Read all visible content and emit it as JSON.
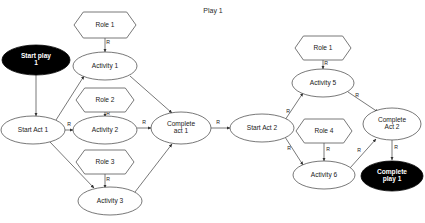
{
  "diagram": {
    "title": "Play 1",
    "title_pos": {
      "x": 213,
      "y": 11
    },
    "colors": {
      "terminal_fill": "#000000",
      "terminal_text": "#ffffff",
      "node_fill": "#ffffff",
      "node_stroke": "#555555",
      "label_text": "#1a1a1a"
    },
    "nodes": [
      {
        "id": "start-play-1",
        "label": "Start play 1",
        "type": "terminal",
        "cx": 36,
        "cy": 60,
        "rx": 34,
        "ry": 15
      },
      {
        "id": "role-1-a",
        "label": "Role 1",
        "type": "role",
        "cx": 105,
        "cy": 25,
        "rx": 31,
        "ry": 13
      },
      {
        "id": "activity-1",
        "label": "Activity 1",
        "type": "activity",
        "cx": 105,
        "cy": 66,
        "rx": 32,
        "ry": 14
      },
      {
        "id": "role-2",
        "label": "Role 2",
        "type": "role",
        "cx": 105,
        "cy": 100,
        "rx": 29,
        "ry": 12
      },
      {
        "id": "start-act-1",
        "label": "Start Act 1",
        "type": "activity",
        "cx": 33,
        "cy": 130,
        "rx": 32,
        "ry": 14
      },
      {
        "id": "activity-2",
        "label": "Activity 2",
        "type": "activity",
        "cx": 105,
        "cy": 130,
        "rx": 32,
        "ry": 14
      },
      {
        "id": "complete-act-1",
        "label_lines": [
          "Complete",
          "act 1"
        ],
        "type": "activity",
        "cx": 181,
        "cy": 128,
        "rx": 30,
        "ry": 16
      },
      {
        "id": "role-3",
        "label": "Role 3",
        "type": "role",
        "cx": 105,
        "cy": 162,
        "rx": 29,
        "ry": 12
      },
      {
        "id": "activity-3",
        "label": "Activity 3",
        "type": "activity",
        "cx": 110,
        "cy": 201,
        "rx": 32,
        "ry": 14
      },
      {
        "id": "start-act-2",
        "label": "Start Act 2",
        "type": "activity",
        "cx": 262,
        "cy": 128,
        "rx": 32,
        "ry": 14
      },
      {
        "id": "role-1-b",
        "label": "Role 1",
        "type": "role",
        "cx": 323,
        "cy": 48,
        "rx": 28,
        "ry": 12
      },
      {
        "id": "activity-5",
        "label": "Activity 5",
        "type": "activity",
        "cx": 323,
        "cy": 83,
        "rx": 31,
        "ry": 14
      },
      {
        "id": "role-4",
        "label": "Role 4",
        "type": "role",
        "cx": 324,
        "cy": 131,
        "rx": 28,
        "ry": 12
      },
      {
        "id": "activity-6",
        "label": "Activity 6",
        "type": "activity",
        "cx": 324,
        "cy": 175,
        "rx": 31,
        "ry": 14
      },
      {
        "id": "complete-act-2",
        "label_lines": [
          "Complete",
          "Act 2"
        ],
        "type": "activity",
        "cx": 392,
        "cy": 124,
        "rx": 29,
        "ry": 16
      },
      {
        "id": "complete-play-1",
        "label_lines": [
          "Complete",
          "play 1"
        ],
        "type": "terminal",
        "cx": 392,
        "cy": 176,
        "rx": 31,
        "ry": 15
      }
    ],
    "edges": [
      {
        "id": "e-startplay-startact1",
        "from": "start-play-1",
        "to": "start-act-1",
        "label": "",
        "path": "M 36,75 L 36,116",
        "arrow": true,
        "label_pos": null
      },
      {
        "id": "e-role1a-activity1",
        "from": "role-1-a",
        "to": "activity-1",
        "label": "R",
        "path": "M 105,38 L 105,52",
        "arrow": true,
        "label_pos": {
          "x": 108,
          "y": 43
        }
      },
      {
        "id": "e-startact1-activity1",
        "from": "start-act-1",
        "to": "activity-1",
        "label": "",
        "path": "M 56,120 L 84,76",
        "arrow": true,
        "label_pos": null
      },
      {
        "id": "e-startact1-activity2",
        "from": "start-act-1",
        "to": "activity-2",
        "label": "R",
        "path": "M 65,130 L 73,130",
        "arrow": true,
        "label_pos": {
          "x": 69,
          "y": 125
        }
      },
      {
        "id": "e-startact1-activity3",
        "from": "start-act-1",
        "to": "activity-3",
        "label": "",
        "path": "M 50,142 L 94,188",
        "arrow": true,
        "label_pos": null
      },
      {
        "id": "e-role2-activity2",
        "from": "role-2",
        "to": "activity-2",
        "label": "R",
        "path": "M 105,112 L 105,117",
        "arrow": true,
        "label_pos": {
          "x": 108,
          "y": 114
        }
      },
      {
        "id": "e-activity1-complete1",
        "from": "activity-1",
        "to": "complete-act-1",
        "label": "",
        "path": "M 130,76 L 172,113",
        "arrow": true,
        "label_pos": null
      },
      {
        "id": "e-activity2-complete1",
        "from": "activity-2",
        "to": "complete-act-1",
        "label": "R",
        "path": "M 137,128 L 151,128",
        "arrow": true,
        "label_pos": {
          "x": 144,
          "y": 123
        }
      },
      {
        "id": "e-role3-activity3",
        "from": "role-3",
        "to": "activity-3",
        "label": "R",
        "path": "M 105,174 L 105,188",
        "arrow": true,
        "label_pos": {
          "x": 108,
          "y": 180
        }
      },
      {
        "id": "e-activity3-complete1",
        "from": "activity-3",
        "to": "complete-act-1",
        "label": "",
        "path": "M 135,192 L 172,144",
        "arrow": true,
        "label_pos": null
      },
      {
        "id": "e-complete1-startact2",
        "from": "complete-act-1",
        "to": "start-act-2",
        "label": "R",
        "path": "M 211,128 L 230,128",
        "arrow": true,
        "label_pos": {
          "x": 218,
          "y": 123
        }
      },
      {
        "id": "e-role1b-activity5",
        "from": "role-1-b",
        "to": "activity-5",
        "label": "R",
        "path": "M 323,60 L 323,69",
        "arrow": true,
        "label_pos": {
          "x": 326,
          "y": 64
        }
      },
      {
        "id": "e-startact2-activity5",
        "from": "start-act-2",
        "to": "activity-5",
        "label": "R",
        "path": "M 285,120 L 303,93",
        "arrow": true,
        "label_pos": {
          "x": 288,
          "y": 112
        }
      },
      {
        "id": "e-startact2-activity6",
        "from": "start-act-2",
        "to": "activity-6",
        "label": "R",
        "path": "M 285,137 L 303,165",
        "arrow": true,
        "label_pos": {
          "x": 289,
          "y": 149
        }
      },
      {
        "id": "e-role4-activity6",
        "from": "role-4",
        "to": "activity-6",
        "label": "R",
        "path": "M 324,143 L 324,161",
        "arrow": true,
        "label_pos": {
          "x": 328,
          "y": 150
        }
      },
      {
        "id": "e-activity5-complete2",
        "from": "activity-5",
        "to": "complete-act-2",
        "label": "R",
        "path": "M 348,92 L 378,112",
        "arrow": true,
        "label_pos": {
          "x": 357,
          "y": 96
        }
      },
      {
        "id": "e-activity6-complete2",
        "from": "activity-6",
        "to": "complete-act-2",
        "label": "R",
        "path": "M 350,168 L 376,139",
        "arrow": true,
        "label_pos": {
          "x": 359,
          "y": 151
        }
      },
      {
        "id": "e-complete2-completeplay",
        "from": "complete-act-2",
        "to": "complete-play-1",
        "label": "R",
        "path": "M 392,140 L 392,160",
        "arrow": true,
        "label_pos": {
          "x": 396,
          "y": 148
        }
      }
    ]
  }
}
